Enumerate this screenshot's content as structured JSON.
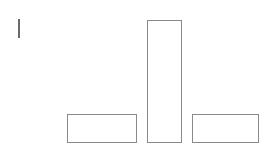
{
  "diagram": {
    "title": "",
    "stroke_color": "#8a8a8a",
    "mark_color": "#6a6a6a",
    "background": "#ffffff",
    "vertical_mark": {
      "x": 18,
      "y": 19,
      "width": 2,
      "height": 19
    },
    "shapes": [
      {
        "id": "left-rect",
        "x": 67,
        "y": 114,
        "width": 70,
        "height": 29
      },
      {
        "id": "center-rect",
        "x": 147,
        "y": 20,
        "width": 35,
        "height": 123
      },
      {
        "id": "right-rect",
        "x": 192,
        "y": 114,
        "width": 67,
        "height": 29
      }
    ]
  }
}
